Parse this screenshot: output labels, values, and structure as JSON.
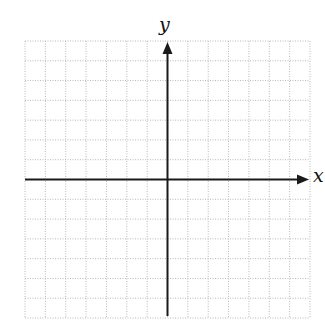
{
  "chart_data": {
    "type": "scatter",
    "title": "",
    "xlabel": "x",
    "ylabel": "y",
    "xlim": [
      -7,
      7
    ],
    "ylim": [
      -7,
      7
    ],
    "grid": true,
    "grid_style": "dotted",
    "tick_labels": [],
    "series": [],
    "x_axis_arrow": "positive-end",
    "y_axis_arrow": "positive-end",
    "colors": {
      "axis": "#1a1a1a",
      "grid": "#b8b8b8",
      "background": "#ffffff"
    }
  },
  "labels": {
    "x_axis": "x",
    "y_axis": "y"
  }
}
